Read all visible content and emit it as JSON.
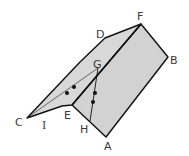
{
  "figure": {
    "type": "geometric-diagram",
    "colors": {
      "face_fill": "#d2d2d2",
      "edge": "#111111",
      "label": "#3a3a3a",
      "point": "#111111"
    },
    "labels": {
      "A": "A",
      "B": "B",
      "C": "C",
      "D": "D",
      "E": "E",
      "F": "F",
      "G": "G",
      "H": "H",
      "I": "I"
    },
    "points_count": 4
  }
}
